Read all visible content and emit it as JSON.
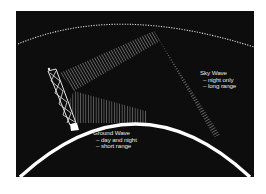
{
  "diagram": {
    "colors": {
      "background": "#0d0d0d",
      "earth": "#ffffff",
      "ionosphere": "#dddddd",
      "wave_hatch": "#bfbfbf"
    },
    "sky_wave": {
      "title": "Sky Wave",
      "lines": [
        "– night only",
        "– long range"
      ]
    },
    "ground_wave": {
      "title": "Ground Wave",
      "lines": [
        "– day and night",
        "– short range"
      ]
    }
  }
}
